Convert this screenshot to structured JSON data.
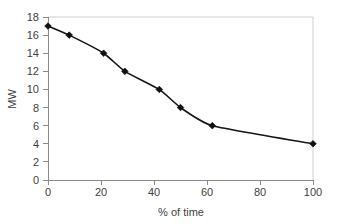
{
  "chart_data": {
    "type": "line",
    "title": "",
    "subtitle": "",
    "xlabel": "% of time",
    "ylabel": "MW",
    "xlim": [
      0,
      100
    ],
    "ylim": [
      0,
      18
    ],
    "x_ticks": [
      0,
      20,
      40,
      60,
      80,
      100
    ],
    "y_ticks": [
      0,
      2,
      4,
      6,
      8,
      10,
      12,
      14,
      16,
      18
    ],
    "x_tick_labels": [
      "0",
      "20",
      "40",
      "60",
      "80",
      "100"
    ],
    "y_tick_labels": [
      "0",
      "2",
      "4",
      "6",
      "8",
      "10",
      "12",
      "14",
      "16",
      "18"
    ],
    "grid": false,
    "legend": false,
    "legend_position": "none",
    "marker": "filled-diamond",
    "line_color": "#161616",
    "marker_color": "#101010",
    "frame_color": "#cfcfcf",
    "axis_color": "#8a8a8a",
    "background": "#ffffff",
    "series": [
      {
        "name": "Load duration",
        "x": [
          0,
          8,
          21,
          29,
          42,
          50,
          62,
          100
        ],
        "y": [
          17,
          16,
          14,
          12,
          10,
          8,
          6,
          4
        ],
        "values": [
          17,
          16,
          14,
          12,
          10,
          8,
          6,
          4
        ]
      }
    ]
  },
  "labels": {
    "x_axis_title": "% of time",
    "y_axis_title": "MW"
  }
}
